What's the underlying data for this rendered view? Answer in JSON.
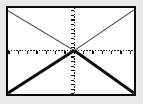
{
  "figure": {
    "title": "",
    "background_color": "#ffffff",
    "margin_color": "#e9e9e9",
    "frame_color": "#0b0b0b",
    "frame_width_px": 2,
    "width_px": 143,
    "height_px": 104
  },
  "chart_data": {
    "type": "line",
    "title": "",
    "subtitle": "",
    "xlabel": "",
    "ylabel": "",
    "xlim": [
      -7.1,
      6.4
    ],
    "ylim": [
      -4.7,
      4.6
    ],
    "grid": false,
    "legend": null,
    "legend_position": "none",
    "annotations": [],
    "axes": {
      "x_axis": {
        "style": "dotted",
        "color": "#111111",
        "y_value": 0,
        "ticks": [
          -7,
          -6,
          -5,
          -4,
          -3,
          -2,
          -1,
          0,
          1,
          2,
          3,
          4,
          5,
          6
        ],
        "tick_labels": [],
        "tick_direction": "down",
        "tick_length_px": 3,
        "tick_interval": 1
      },
      "y_axis": {
        "style": "dotted",
        "color": "#111111",
        "x_value": 0,
        "ticks": [
          -4,
          -3,
          -2,
          -1,
          0,
          1,
          2,
          3,
          4
        ],
        "tick_labels": [],
        "tick_direction": "left",
        "tick_length_px": 3,
        "tick_interval": 0.5
      },
      "origin": {
        "x": 0,
        "y": 0,
        "pixel_x": 71,
        "pixel_y": 53
      }
    },
    "series": [
      {
        "name": "upper-left ray",
        "equation": "y = -x, x <= 0",
        "stroke_width_px": 1,
        "color": "#2b2b2b",
        "weight": "thin",
        "x": [
          -7.1,
          0
        ],
        "values": [
          4.3,
          0
        ]
      },
      {
        "name": "upper-right ray",
        "equation": "y = x, x >= 0",
        "stroke_width_px": 1,
        "color": "#2b2b2b",
        "weight": "thin",
        "x": [
          0,
          6.4
        ],
        "values": [
          0,
          4.4
        ]
      },
      {
        "name": "lower-left ray",
        "equation": "y = x, x <= 0",
        "stroke_width_px": 3,
        "color": "#0b0b0b",
        "weight": "thick",
        "x": [
          -7.1,
          0
        ],
        "values": [
          -4.6,
          0
        ]
      },
      {
        "name": "lower-right ray",
        "equation": "y = -x, x >= 0",
        "stroke_width_px": 3,
        "color": "#0b0b0b",
        "weight": "thick",
        "x": [
          0,
          6.4
        ],
        "values": [
          0,
          -4.6
        ]
      }
    ]
  }
}
